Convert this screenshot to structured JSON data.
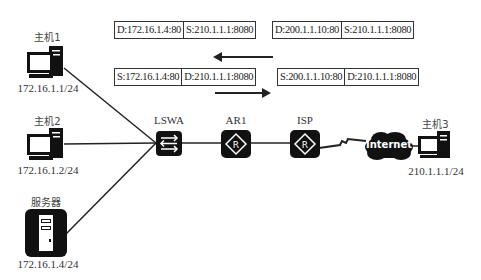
{
  "hosts": [
    {
      "name": "主机1",
      "ip": "172.16.1.1/24",
      "type": "pc-icon"
    },
    {
      "name": "主机2",
      "ip": "172.16.1.2/24",
      "type": "pc-icon"
    },
    {
      "name": "服务器",
      "ip": "172.16.1.4/24",
      "type": "server-icon"
    },
    {
      "name": "主机3",
      "ip": "210.1.1.1/24",
      "type": "pc-icon"
    }
  ],
  "devices": [
    {
      "name": "LSWA",
      "type": "switch-icon"
    },
    {
      "name": "AR1",
      "type": "router-icon"
    },
    {
      "name": "ISP",
      "type": "router-icon"
    }
  ],
  "cloud": {
    "label": "Internet"
  },
  "packets": {
    "return_inside": {
      "dst": "D:172.16.1.4:80",
      "src": "S:210.1.1.1:8080"
    },
    "return_outside": {
      "dst": "D:200.1.1.10:80",
      "src": "S:210.1.1.1:8080"
    },
    "request_inside": {
      "src": "S:172.16.1.4:80",
      "dst": "D:210.1.1.1:8080"
    },
    "request_outside": {
      "src": "S:200.1.1.10:80",
      "dst": "D:210.1.1.1:8080"
    }
  },
  "arrows": {
    "top": "left",
    "bottom": "right"
  }
}
